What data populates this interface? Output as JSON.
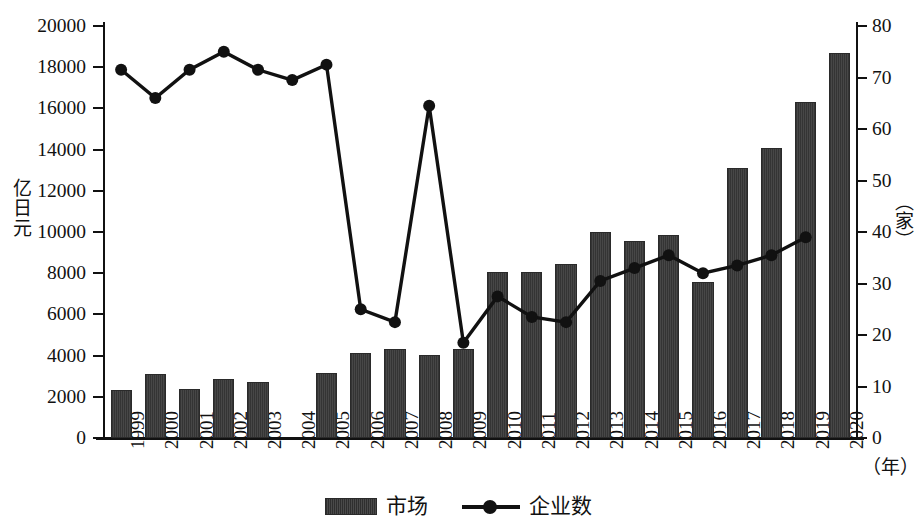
{
  "chart_data": {
    "type": "bar",
    "title": "",
    "xlabel": "（年）",
    "ylabel": "亿日元",
    "y2label": "（家）",
    "ylim": [
      0,
      20000
    ],
    "y2lim": [
      0,
      80
    ],
    "ytick_labels": [
      "20000",
      "18000",
      "16000",
      "14000",
      "12000",
      "10000",
      "8000",
      "6000",
      "4000",
      "2000",
      "0"
    ],
    "ytick_values": [
      20000,
      18000,
      16000,
      14000,
      12000,
      10000,
      8000,
      6000,
      4000,
      2000,
      0
    ],
    "y2tick_labels": [
      "80",
      "70",
      "60",
      "50",
      "40",
      "30",
      "20",
      "10",
      "0"
    ],
    "y2tick_values": [
      80,
      70,
      60,
      50,
      40,
      30,
      20,
      10,
      0
    ],
    "categories": [
      "1999",
      "2000",
      "2001",
      "2002",
      "2003",
      "2004",
      "2005",
      "2006",
      "2007",
      "2008",
      "2009",
      "2010",
      "2011",
      "2012",
      "2013",
      "2014",
      "2015",
      "2016",
      "2017",
      "2018",
      "2019",
      "2020"
    ],
    "grid": false,
    "legend_position": "bottom",
    "series": [
      {
        "name": "市场",
        "type": "bar",
        "axis": "left",
        "unit": "亿日元",
        "color": "#3b3b3b",
        "values": [
          2320,
          3120,
          2380,
          2850,
          2700,
          null,
          3150,
          4120,
          4320,
          4020,
          4320,
          8050,
          8080,
          8450,
          10000,
          9550,
          9850,
          7550,
          13100,
          14100,
          16300,
          18700
        ]
      },
      {
        "name": "企业数",
        "type": "line",
        "axis": "right",
        "unit": "家",
        "color": "#111111",
        "values": [
          71.5,
          66,
          71.5,
          75,
          71.5,
          69.5,
          72.5,
          25,
          22.5,
          64.5,
          18.5,
          27.5,
          23.5,
          22.5,
          30.5,
          33,
          35.5,
          32,
          33.5,
          35.5,
          39,
          null
        ]
      }
    ]
  },
  "legend": {
    "items": [
      {
        "label": "市场",
        "marker": "bar-swatch"
      },
      {
        "label": "企业数",
        "marker": "line-dot-swatch"
      }
    ]
  }
}
